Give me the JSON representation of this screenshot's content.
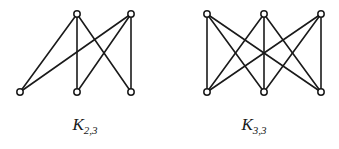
{
  "figure": {
    "background_color": "#ffffff",
    "stroke_color": "#1a1a1a"
  },
  "graphs": [
    {
      "id": "k23",
      "name": "complete-bipartite-graph-k-2-3",
      "caption_base": "K",
      "caption_subscript": "2,3",
      "caption_full": "K2,3",
      "part_sizes": [
        2,
        3
      ],
      "vertex_count": 5,
      "edge_count": 6,
      "top_vertices": [
        {
          "label": "u1",
          "x": 77,
          "y": 14
        },
        {
          "label": "u2",
          "x": 131,
          "y": 14
        }
      ],
      "bottom_vertices": [
        {
          "label": "v1",
          "x": 20,
          "y": 92
        },
        {
          "label": "v2",
          "x": 77,
          "y": 92
        },
        {
          "label": "v3",
          "x": 131,
          "y": 92
        }
      ],
      "edges": [
        {
          "from": "u1",
          "to": "v1"
        },
        {
          "from": "u1",
          "to": "v2"
        },
        {
          "from": "u1",
          "to": "v3"
        },
        {
          "from": "u2",
          "to": "v1"
        },
        {
          "from": "u2",
          "to": "v2"
        },
        {
          "from": "u2",
          "to": "v3"
        }
      ]
    },
    {
      "id": "k33",
      "name": "complete-bipartite-graph-k-3-3",
      "caption_base": "K",
      "caption_subscript": "3,3",
      "caption_full": "K3,3",
      "part_sizes": [
        3,
        3
      ],
      "vertex_count": 6,
      "edge_count": 9,
      "top_vertices": [
        {
          "label": "a1",
          "x": 207,
          "y": 14
        },
        {
          "label": "a2",
          "x": 264,
          "y": 14
        },
        {
          "label": "a3",
          "x": 321,
          "y": 14
        }
      ],
      "bottom_vertices": [
        {
          "label": "b1",
          "x": 207,
          "y": 92
        },
        {
          "label": "b2",
          "x": 264,
          "y": 92
        },
        {
          "label": "b3",
          "x": 321,
          "y": 92
        }
      ],
      "edges": [
        {
          "from": "a1",
          "to": "b1"
        },
        {
          "from": "a1",
          "to": "b2"
        },
        {
          "from": "a1",
          "to": "b3"
        },
        {
          "from": "a2",
          "to": "b1"
        },
        {
          "from": "a2",
          "to": "b2"
        },
        {
          "from": "a2",
          "to": "b3"
        },
        {
          "from": "a3",
          "to": "b1"
        },
        {
          "from": "a3",
          "to": "b2"
        },
        {
          "from": "a3",
          "to": "b3"
        }
      ]
    }
  ],
  "style": {
    "vertex_radius": 3.2,
    "vertex_fill": "#ffffff",
    "vertex_stroke": "#1a1a1a",
    "edge_width": 1.6
  }
}
